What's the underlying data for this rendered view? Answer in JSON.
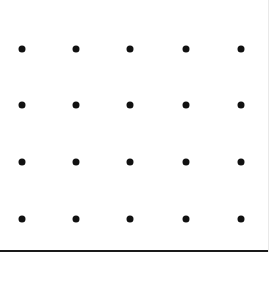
{
  "canvas": {
    "width": 271,
    "height": 291,
    "background_color": "#ffffff"
  },
  "chart_data": {
    "type": "scatter",
    "title": "",
    "subtitle": "",
    "xlabel": "",
    "ylabel": "",
    "grid": false,
    "legend": null,
    "marker": {
      "shape": "circle",
      "color": "#111111",
      "size_px": 7
    },
    "xlim": [
      0,
      271
    ],
    "ylim": [
      0,
      291
    ],
    "x_tick_labels": [],
    "y_tick_labels": [],
    "columns": 5,
    "rows": 4,
    "column_positions": [
      22,
      76,
      130,
      186,
      241
    ],
    "row_positions": [
      49,
      105,
      162,
      219
    ],
    "points": [
      {
        "x": 22,
        "y": 49
      },
      {
        "x": 76,
        "y": 49
      },
      {
        "x": 130,
        "y": 49
      },
      {
        "x": 186,
        "y": 49
      },
      {
        "x": 241,
        "y": 49
      },
      {
        "x": 22,
        "y": 105
      },
      {
        "x": 76,
        "y": 105
      },
      {
        "x": 130,
        "y": 105
      },
      {
        "x": 186,
        "y": 105
      },
      {
        "x": 241,
        "y": 105
      },
      {
        "x": 22,
        "y": 162
      },
      {
        "x": 76,
        "y": 162
      },
      {
        "x": 130,
        "y": 162
      },
      {
        "x": 186,
        "y": 162
      },
      {
        "x": 241,
        "y": 162
      },
      {
        "x": 22,
        "y": 219
      },
      {
        "x": 76,
        "y": 219
      },
      {
        "x": 130,
        "y": 219
      },
      {
        "x": 186,
        "y": 219
      },
      {
        "x": 241,
        "y": 219
      }
    ],
    "annotations": []
  },
  "axes": {
    "bottom_rule": {
      "y": 250,
      "thickness": 2,
      "color": "#1a1a1a",
      "length": 269
    },
    "right_rule": {
      "x": 268,
      "thickness": 1,
      "color": "#e9e9e9",
      "length": 252
    }
  }
}
